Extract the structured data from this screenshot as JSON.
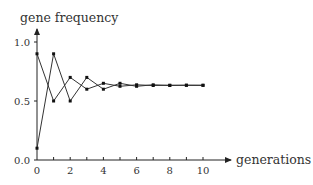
{
  "chart_data": {
    "type": "line",
    "title": "",
    "xlabel": "generations",
    "ylabel": "gene frequency",
    "xlim": [
      0,
      10
    ],
    "ylim": [
      0,
      1.0
    ],
    "x_ticks": [
      "0",
      "2",
      "4",
      "6",
      "8",
      "10"
    ],
    "y_ticks": [
      "0.0",
      "0.5",
      "1.0"
    ],
    "grid": false,
    "legend": null,
    "x": [
      0,
      1,
      2,
      3,
      4,
      5,
      6,
      7,
      8,
      9,
      10
    ],
    "series": [
      {
        "name": "series-a",
        "values": [
          0.9,
          0.5,
          0.7,
          0.6,
          0.65,
          0.625,
          0.6375,
          0.631,
          0.634,
          0.633,
          0.633
        ]
      },
      {
        "name": "series-b",
        "values": [
          0.1,
          0.9,
          0.5,
          0.7,
          0.6,
          0.65,
          0.625,
          0.6375,
          0.631,
          0.634,
          0.633
        ]
      }
    ]
  },
  "labels": {
    "ylabel": "gene frequency",
    "xlabel": "generations",
    "y0": "0.0",
    "y05": "0.5",
    "y1": "1.0",
    "x0": "0",
    "x2": "2",
    "x4": "4",
    "x6": "6",
    "x8": "8",
    "x10": "10"
  }
}
